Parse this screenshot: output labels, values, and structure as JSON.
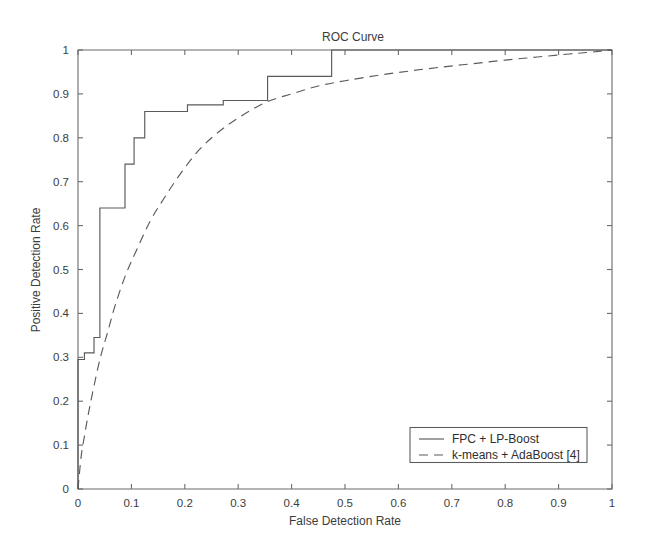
{
  "chart_data": {
    "type": "line",
    "title": "ROC Curve",
    "xlabel": "False Detection Rate",
    "ylabel": "Positive Detection Rate",
    "xlim": [
      0,
      1
    ],
    "ylim": [
      0,
      1
    ],
    "grid": false,
    "legend_position": "lower right",
    "xticks": [
      0,
      0.1,
      0.2,
      0.3,
      0.4,
      0.5,
      0.6,
      0.7,
      0.8,
      0.9,
      1
    ],
    "yticks": [
      0,
      0.1,
      0.2,
      0.3,
      0.4,
      0.5,
      0.6,
      0.7,
      0.8,
      0.9,
      1
    ],
    "xtick_labels": [
      "0",
      "0.1",
      "0.2",
      "0.3",
      "0.4",
      "0.5",
      "0.6",
      "0.7",
      "0.8",
      "0.9",
      "1"
    ],
    "ytick_labels": [
      "0",
      "0.1",
      "0.2",
      "0.3",
      "0.4",
      "0.5",
      "0.6",
      "0.7",
      "0.8",
      "0.9",
      "1"
    ],
    "series": [
      {
        "name": "FPC + LP-Boost",
        "style": "solid",
        "color": "#5a5a5a",
        "shape": "step",
        "x": [
          0,
          0,
          0.012,
          0.012,
          0.03,
          0.03,
          0.041,
          0.041,
          0.055,
          0.055,
          0.088,
          0.088,
          0.105,
          0.105,
          0.125,
          0.125,
          0.205,
          0.205,
          0.272,
          0.272,
          0.3,
          0.3,
          0.355,
          0.355,
          0.475,
          0.475,
          1
        ],
        "y": [
          0,
          0.295,
          0.295,
          0.31,
          0.31,
          0.345,
          0.345,
          0.64,
          0.64,
          0.64,
          0.64,
          0.74,
          0.74,
          0.8,
          0.8,
          0.86,
          0.86,
          0.875,
          0.875,
          0.885,
          0.885,
          0.885,
          0.885,
          0.94,
          0.94,
          1.0,
          1.0
        ]
      },
      {
        "name": "k-means + AdaBoost [4]",
        "style": "dashed",
        "color": "#5a5a5a",
        "shape": "smooth",
        "x": [
          0,
          0.006,
          0.012,
          0.02,
          0.03,
          0.042,
          0.055,
          0.07,
          0.09,
          0.11,
          0.135,
          0.16,
          0.19,
          0.225,
          0.26,
          0.3,
          0.35,
          0.4,
          0.45,
          0.5,
          0.56,
          0.62,
          0.68,
          0.74,
          0.8,
          0.86,
          0.92,
          0.96,
          1.0
        ],
        "y": [
          0,
          0.075,
          0.12,
          0.175,
          0.235,
          0.3,
          0.355,
          0.42,
          0.49,
          0.545,
          0.61,
          0.66,
          0.715,
          0.77,
          0.81,
          0.845,
          0.88,
          0.9,
          0.918,
          0.93,
          0.942,
          0.952,
          0.961,
          0.969,
          0.977,
          0.984,
          0.991,
          0.995,
          1.0
        ]
      }
    ]
  },
  "legend": {
    "entries": [
      {
        "label": "FPC + LP-Boost",
        "style": "solid"
      },
      {
        "label": "k-means + AdaBoost [4]",
        "style": "dashed"
      }
    ]
  }
}
